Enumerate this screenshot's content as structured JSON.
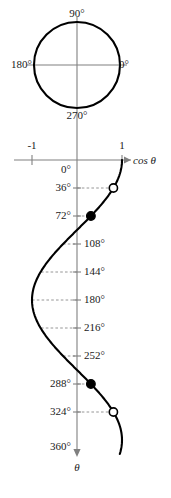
{
  "figure": {
    "title_visible": false,
    "colors": {
      "curve": "#000000",
      "axis": "#808080",
      "dashed_guide": "#808080",
      "text": "#1a1a1a",
      "marker_fill": "#000000",
      "marker_open": "#ffffff",
      "background": "#ffffff"
    }
  },
  "unit_circle": {
    "name": "unit-circle",
    "labels": {
      "top": "90°",
      "right": "0°",
      "bottom": "270°",
      "left": "180°"
    },
    "center_px": [
      77,
      65
    ],
    "radius_px": 43
  },
  "cos_axis": {
    "label": "cos θ",
    "ticks": [
      {
        "label": "-1",
        "value": -1
      },
      {
        "label": "1",
        "value": 1
      }
    ],
    "origin_label": "0°"
  },
  "theta_axis": {
    "label": "θ",
    "direction": "down",
    "ticks": [
      {
        "label": "0°",
        "value": 0,
        "side": "left"
      },
      {
        "label": "36°",
        "value": 36,
        "side": "left"
      },
      {
        "label": "72°",
        "value": 72,
        "side": "left"
      },
      {
        "label": "108°",
        "value": 108,
        "side": "right"
      },
      {
        "label": "144°",
        "value": 144,
        "side": "right"
      },
      {
        "label": "180°",
        "value": 180,
        "side": "right"
      },
      {
        "label": "216°",
        "value": 216,
        "side": "right"
      },
      {
        "label": "252°",
        "value": 252,
        "side": "right"
      },
      {
        "label": "288°",
        "value": 288,
        "side": "left"
      },
      {
        "label": "324°",
        "value": 324,
        "side": "left"
      },
      {
        "label": "360°",
        "value": 360,
        "side": "left"
      }
    ]
  },
  "markers": [
    {
      "theta": 36,
      "cos": 0.809,
      "style": "open"
    },
    {
      "theta": 72,
      "cos": 0.309,
      "style": "filled"
    },
    {
      "theta": 288,
      "cos": 0.309,
      "style": "filled"
    },
    {
      "theta": 324,
      "cos": 0.809,
      "style": "open"
    }
  ],
  "guide_lines": [
    {
      "theta": 36,
      "to_cos": 0.809
    },
    {
      "theta": 72,
      "to_cos": 0.309
    },
    {
      "theta": 108,
      "to_cos": -0.309
    },
    {
      "theta": 144,
      "to_cos": -0.809
    },
    {
      "theta": 180,
      "to_cos": -1.0
    },
    {
      "theta": 216,
      "to_cos": -0.809
    },
    {
      "theta": 252,
      "to_cos": -0.309
    },
    {
      "theta": 288,
      "to_cos": 0.309
    },
    {
      "theta": 324,
      "to_cos": 0.809
    }
  ],
  "chart_data": {
    "type": "line",
    "title": "",
    "xlabel": "cos θ",
    "ylabel": "θ",
    "orientation": "theta-vertical-downward",
    "xlim": [
      -1,
      1
    ],
    "ylim": [
      0,
      360
    ],
    "grid": false,
    "series": [
      {
        "name": "cos θ",
        "x_is": "cos(theta)",
        "theta": [
          0,
          18,
          36,
          54,
          72,
          90,
          108,
          126,
          144,
          162,
          180,
          198,
          216,
          234,
          252,
          270,
          288,
          306,
          324,
          342,
          360,
          378
        ],
        "values": [
          1.0,
          0.951,
          0.809,
          0.588,
          0.309,
          0.0,
          -0.309,
          -0.588,
          -0.809,
          -0.951,
          -1.0,
          -0.951,
          -0.809,
          -0.588,
          -0.309,
          0.0,
          0.309,
          0.588,
          0.809,
          0.951,
          1.0,
          0.951
        ]
      }
    ],
    "annotations": [
      {
        "theta": 36,
        "cos": 0.809,
        "marker": "open"
      },
      {
        "theta": 72,
        "cos": 0.309,
        "marker": "filled"
      },
      {
        "theta": 288,
        "cos": 0.309,
        "marker": "filled"
      },
      {
        "theta": 324,
        "cos": 0.809,
        "marker": "open"
      }
    ]
  }
}
